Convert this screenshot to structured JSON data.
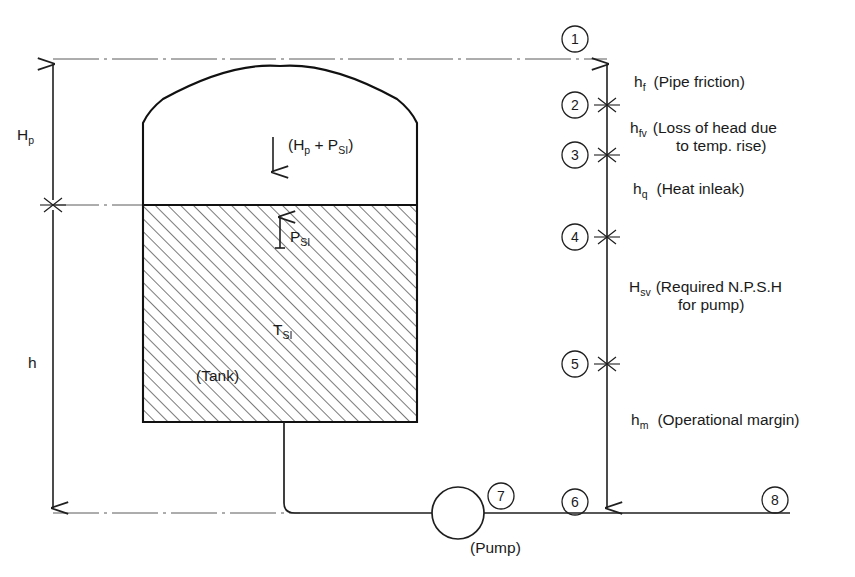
{
  "diagram": {
    "tank": {
      "label": "(Tank)",
      "vapour_space_label": "(H",
      "vapour_space_label_sub": "p",
      "vapour_space_label_mid": " + P",
      "vapour_space_label_sub2": "SI",
      "vapour_space_label_end": ")",
      "pressure_label": "P",
      "pressure_label_sub": "SI",
      "temperature_label": "T",
      "temperature_label_sub": "SI"
    },
    "pump": {
      "label": "(Pump)"
    },
    "left_dimensions": [
      {
        "symbol": "H",
        "subscript": "p",
        "name": "pressure-head-dimension"
      },
      {
        "symbol": "h",
        "subscript": "",
        "name": "static-height-dimension"
      }
    ],
    "right_dimensions": [
      {
        "symbol": "h",
        "subscript": "f",
        "description_line1": "(Pipe friction)",
        "description_line2": ""
      },
      {
        "symbol": "h",
        "subscript": "fv",
        "description_line1": "(Loss of  head  due",
        "description_line2": "to  temp. rise)"
      },
      {
        "symbol": "h",
        "subscript": "q",
        "description_line1": "(Heat inleak)",
        "description_line2": ""
      },
      {
        "symbol": "H",
        "subscript": "sv",
        "description_line1": "(Required  N.P.S.H",
        "description_line2": "for  pump)"
      },
      {
        "symbol": "h",
        "subscript": "m",
        "description_line1": "(Operational  margin)",
        "description_line2": ""
      }
    ],
    "station_markers": [
      {
        "id": "1",
        "label": "1"
      },
      {
        "id": "2",
        "label": "2"
      },
      {
        "id": "3",
        "label": "3"
      },
      {
        "id": "4",
        "label": "4"
      },
      {
        "id": "5",
        "label": "5"
      },
      {
        "id": "6",
        "label": "6"
      },
      {
        "id": "7",
        "label": "7"
      },
      {
        "id": "8",
        "label": "8"
      }
    ],
    "colors": {
      "ink": "#1a1a1a",
      "line": "#1f1f1f",
      "datum": "#5a5a5a",
      "hatch": "#2b2b2b",
      "background": "#ffffff"
    }
  }
}
